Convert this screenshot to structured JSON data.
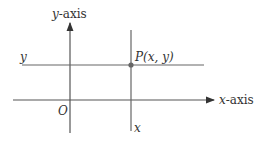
{
  "diagram": {
    "y_axis_label": "y-axis",
    "x_axis_label": "x-axis",
    "origin_label": "O",
    "horizontal_line_label": "y",
    "vertical_line_label": "x",
    "point_label": "P(x, y)",
    "colors": {
      "line": "#555555",
      "point": "#666666",
      "text": "#333333"
    }
  }
}
